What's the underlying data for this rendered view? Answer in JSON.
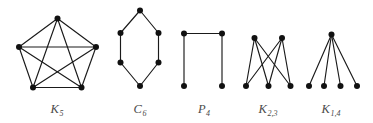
{
  "figure": {
    "background_color": "#ffffff",
    "edge_color": "#1a1a1a",
    "vertex_color": "#111111",
    "label_color": "#4a4a4a",
    "width": 373,
    "height": 123
  },
  "graphs": [
    {
      "id": "k5",
      "name": "complete-graph-k5",
      "label_base": "K",
      "label_sub": "5",
      "label_full": "K5",
      "label_x": 57,
      "label_y": 113,
      "vertex_count": 5,
      "edge_count": 10,
      "vertex_radius": 3.0,
      "vertices": [
        {
          "id": "v0",
          "x": 57.5,
          "y": 18.5
        },
        {
          "id": "v1",
          "x": 96.0,
          "y": 47.0
        },
        {
          "id": "v2",
          "x": 81.5,
          "y": 87.5
        },
        {
          "id": "v3",
          "x": 33.0,
          "y": 87.5
        },
        {
          "id": "v4",
          "x": 19.0,
          "y": 47.0
        }
      ],
      "edges": [
        [
          "v0",
          "v1"
        ],
        [
          "v0",
          "v2"
        ],
        [
          "v0",
          "v3"
        ],
        [
          "v0",
          "v4"
        ],
        [
          "v1",
          "v2"
        ],
        [
          "v1",
          "v3"
        ],
        [
          "v1",
          "v4"
        ],
        [
          "v2",
          "v3"
        ],
        [
          "v2",
          "v4"
        ],
        [
          "v3",
          "v4"
        ]
      ]
    },
    {
      "id": "c6",
      "name": "cycle-graph-c6",
      "label_base": "C",
      "label_sub": "6",
      "label_full": "C6",
      "label_x": 140,
      "label_y": 113,
      "vertex_count": 6,
      "edge_count": 6,
      "vertex_radius": 3.0,
      "vertices": [
        {
          "id": "v0",
          "x": 140.0,
          "y": 10.5
        },
        {
          "id": "v1",
          "x": 158.5,
          "y": 33.0
        },
        {
          "id": "v2",
          "x": 158.5,
          "y": 62.5
        },
        {
          "id": "v3",
          "x": 140.0,
          "y": 86.0
        },
        {
          "id": "v4",
          "x": 120.5,
          "y": 62.5
        },
        {
          "id": "v5",
          "x": 120.5,
          "y": 33.0
        }
      ],
      "edges": [
        [
          "v0",
          "v1"
        ],
        [
          "v1",
          "v2"
        ],
        [
          "v2",
          "v3"
        ],
        [
          "v3",
          "v4"
        ],
        [
          "v4",
          "v5"
        ],
        [
          "v5",
          "v0"
        ]
      ]
    },
    {
      "id": "p4",
      "name": "path-graph-p4",
      "label_base": "P",
      "label_sub": "4",
      "label_full": "P4",
      "label_x": 204,
      "label_y": 113,
      "vertex_count": 4,
      "edge_count": 3,
      "vertex_radius": 3.0,
      "vertices": [
        {
          "id": "v0",
          "x": 184.0,
          "y": 86.0
        },
        {
          "id": "v1",
          "x": 184.0,
          "y": 33.5
        },
        {
          "id": "v2",
          "x": 222.0,
          "y": 33.5
        },
        {
          "id": "v3",
          "x": 222.0,
          "y": 86.0
        }
      ],
      "edges": [
        [
          "v0",
          "v1"
        ],
        [
          "v1",
          "v2"
        ],
        [
          "v2",
          "v3"
        ]
      ]
    },
    {
      "id": "k23",
      "name": "complete-bipartite-graph-k2-3",
      "label_base": "K",
      "label_sub": "2,3",
      "label_full": "K2,3",
      "label_x": 268,
      "label_y": 113,
      "vertex_count": 5,
      "edge_count": 6,
      "vertex_radius": 3.0,
      "vertices": [
        {
          "id": "a0",
          "x": 254.5,
          "y": 38.0
        },
        {
          "id": "a1",
          "x": 282.0,
          "y": 38.0
        },
        {
          "id": "b0",
          "x": 246.0,
          "y": 86.0
        },
        {
          "id": "b1",
          "x": 268.5,
          "y": 86.0
        },
        {
          "id": "b2",
          "x": 290.5,
          "y": 86.0
        }
      ],
      "edges": [
        [
          "a0",
          "b0"
        ],
        [
          "a0",
          "b1"
        ],
        [
          "a0",
          "b2"
        ],
        [
          "a1",
          "b0"
        ],
        [
          "a1",
          "b1"
        ],
        [
          "a1",
          "b2"
        ]
      ]
    },
    {
      "id": "k14",
      "name": "star-graph-k1-4",
      "label_base": "K",
      "label_sub": "1,4",
      "label_full": "K1,4",
      "label_x": 331,
      "label_y": 113,
      "vertex_count": 5,
      "edge_count": 4,
      "vertex_radius": 3.0,
      "vertices": [
        {
          "id": "c",
          "x": 331.5,
          "y": 34.5
        },
        {
          "id": "l0",
          "x": 309.0,
          "y": 86.0
        },
        {
          "id": "l1",
          "x": 324.0,
          "y": 86.0
        },
        {
          "id": "l2",
          "x": 340.5,
          "y": 86.0
        },
        {
          "id": "l3",
          "x": 357.0,
          "y": 86.0
        }
      ],
      "edges": [
        [
          "c",
          "l0"
        ],
        [
          "c",
          "l1"
        ],
        [
          "c",
          "l2"
        ],
        [
          "c",
          "l3"
        ]
      ]
    }
  ]
}
